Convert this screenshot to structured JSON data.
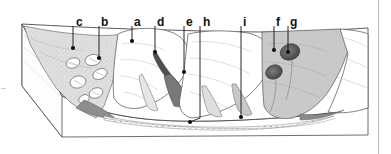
{
  "figure": {
    "type": "geologic-block-diagram",
    "background_color": "#ffffff",
    "outline_color": "#3a3a3a",
    "leader_color": "#111111"
  },
  "labels": [
    {
      "id": "c",
      "text": "c",
      "x": 76,
      "y": 16,
      "line_x": 73,
      "line_y1": 26,
      "line_y2": 48,
      "dot_x": 73,
      "dot_y": 48
    },
    {
      "id": "b",
      "text": "b",
      "x": 101,
      "y": 16,
      "line_x": 99,
      "line_y1": 26,
      "line_y2": 58,
      "dot_x": 99,
      "dot_y": 58
    },
    {
      "id": "a",
      "text": "a",
      "x": 134,
      "y": 16,
      "line_x": 132,
      "line_y1": 26,
      "line_y2": 41,
      "dot_x": 132,
      "dot_y": 41
    },
    {
      "id": "d",
      "text": "d",
      "x": 157,
      "y": 16,
      "line_x": 155,
      "line_y1": 26,
      "line_y2": 52,
      "dot_x": 155,
      "dot_y": 52
    },
    {
      "id": "e",
      "text": "e",
      "x": 186,
      "y": 16,
      "line_x": 184,
      "line_y1": 26,
      "line_y2": 72,
      "dot_x": 184,
      "dot_y": 72
    },
    {
      "id": "h",
      "text": "h",
      "x": 203,
      "y": 16,
      "line_x": 200,
      "line_y1": 26,
      "line_y2": 118,
      "dot_x": 190,
      "dot_y": 122
    },
    {
      "id": "i",
      "text": "i",
      "x": 243,
      "y": 16,
      "line_x": 241,
      "line_y1": 26,
      "line_y2": 117,
      "dot_x": 241,
      "dot_y": 117
    },
    {
      "id": "f",
      "text": "f",
      "x": 276,
      "y": 16,
      "line_x": 274,
      "line_y1": 26,
      "line_y2": 50,
      "dot_x": 274,
      "dot_y": 50
    },
    {
      "id": "g",
      "text": "g",
      "x": 290,
      "y": 16,
      "line_x": 288,
      "line_y1": 26,
      "line_y2": 52,
      "dot_x": 288,
      "dot_y": 52
    }
  ],
  "colors": {
    "talus_left_fill": "#dedede",
    "slope_right_fill": "#c9c9c9",
    "scar_dark": "#5a5a5a",
    "valley_floor_fill": "#fbfbfb",
    "block_side_fill": "#fefefe",
    "outline": "#4a4a4a",
    "faint_rule": "#b9b9b9"
  },
  "features": {
    "talus_apron_label": "talus / scree apron",
    "boulder_field_label": "boulder field",
    "ridge_crest_label": "ridge crest",
    "gully_label": "gully / chute",
    "debris_cone_label": "debris cone",
    "valley_floor_label": "stippled valley floor",
    "slump_scar_label": "slump scar",
    "landslide_scar_label": "landslide scar"
  }
}
